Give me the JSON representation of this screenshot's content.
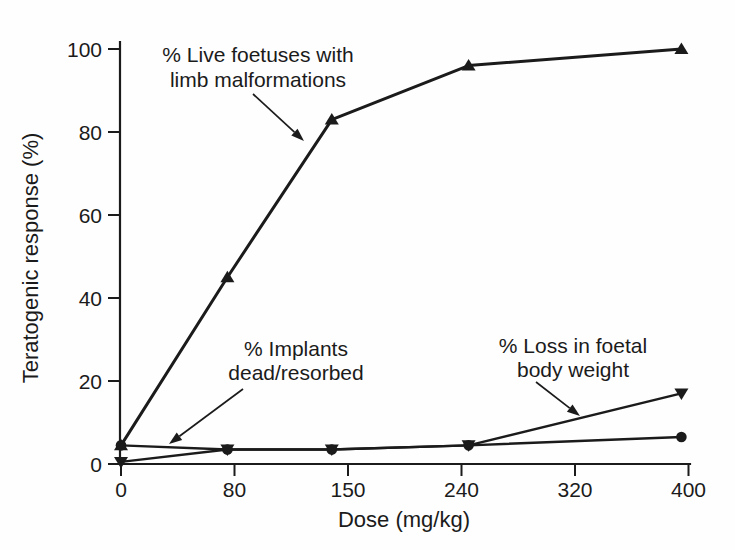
{
  "figure": {
    "background_color": "#fefefe",
    "ink_color": "#1b1b1b"
  },
  "chart_data": {
    "type": "line",
    "title": "",
    "xlabel": "Dose (mg/kg)",
    "ylabel": "Teratogenic response (%)",
    "x_tick_labels": [
      0,
      80,
      150,
      240,
      320,
      400
    ],
    "y_tick_labels": [
      0,
      20,
      40,
      60,
      80,
      100
    ],
    "xlim": [
      0,
      400
    ],
    "ylim": [
      0,
      100
    ],
    "grid": false,
    "legend": "inline-annotations",
    "x": [
      0,
      75,
      140,
      245,
      395
    ],
    "series": [
      {
        "id": "limb-malformations",
        "name": "% Live foetuses with limb malformations",
        "marker": "triangle-up",
        "line_width": 3,
        "values": [
          4.5,
          45,
          83,
          96,
          100
        ]
      },
      {
        "id": "implants-dead-resorbed",
        "name": "% Implants dead/resorbed",
        "marker": "circle",
        "line_width": 2.4,
        "values": [
          4.5,
          3.5,
          3.5,
          4.5,
          6.5
        ]
      },
      {
        "id": "foetal-weight-loss",
        "name": "% Loss in foetal body weight",
        "marker": "triangle-down",
        "line_width": 2.4,
        "values": [
          0.5,
          3.5,
          3.5,
          4.5,
          17
        ]
      }
    ],
    "annotations": [
      {
        "id": "limb-malformations-label",
        "lines": [
          "% Live foetuses with",
          "limb malformations"
        ],
        "text_x": 258,
        "text_y": 62,
        "line_gap": 25,
        "arrow": {
          "x1": 253,
          "y1": 94,
          "x2": 304,
          "y2": 141
        }
      },
      {
        "id": "implants-label",
        "lines": [
          "% Implants",
          "dead/resorbed"
        ],
        "text_x": 296,
        "text_y": 356,
        "line_gap": 24,
        "arrow": {
          "x1": 243,
          "y1": 389,
          "x2": 169,
          "y2": 444
        }
      },
      {
        "id": "weight-loss-label",
        "lines": [
          "% Loss in foetal",
          "body weight"
        ],
        "text_x": 573,
        "text_y": 353,
        "line_gap": 24,
        "arrow": {
          "x1": 536,
          "y1": 382,
          "x2": 580,
          "y2": 416
        }
      }
    ],
    "layout": {
      "axis_x_px": 120,
      "axis_top_px": 42,
      "baseline_y_px": 464,
      "y100_px": 49,
      "x0_px": 121,
      "tick_dx_px": 113.5,
      "tick_len_px": 12,
      "tick_font_px": 21,
      "label_font_px": 22,
      "annotation_font_px": 21
    }
  }
}
